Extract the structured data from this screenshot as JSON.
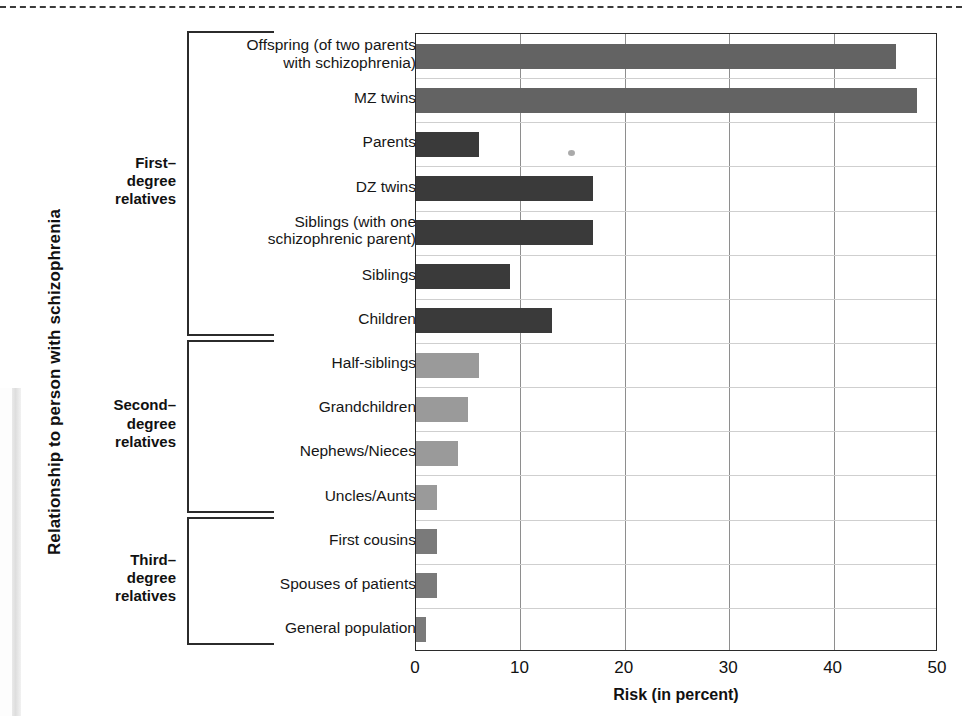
{
  "axes": {
    "y_title": "Relationship to person with schizophrenia",
    "x_title": "Risk (in percent)",
    "x_ticks": [
      "0",
      "10",
      "20",
      "30",
      "40",
      "50"
    ]
  },
  "groups": [
    {
      "name_line1": "First–",
      "name_line2": "degree",
      "name_line3": "relatives"
    },
    {
      "name_line1": "Second–",
      "name_line2": "degree",
      "name_line3": "relatives"
    },
    {
      "name_line1": "Third–",
      "name_line2": "degree",
      "name_line3": "relatives"
    }
  ],
  "categories": [
    {
      "line1": "Offspring (of two parents",
      "line2": "with schizophrenia)"
    },
    {
      "line1": "MZ twins",
      "line2": ""
    },
    {
      "line1": "Parents",
      "line2": ""
    },
    {
      "line1": "DZ twins",
      "line2": ""
    },
    {
      "line1": "Siblings (with one",
      "line2": "schizophrenic parent)"
    },
    {
      "line1": "Siblings",
      "line2": ""
    },
    {
      "line1": "Children",
      "line2": ""
    },
    {
      "line1": "Half-siblings",
      "line2": ""
    },
    {
      "line1": "Grandchildren",
      "line2": ""
    },
    {
      "line1": "Nephews/Nieces",
      "line2": ""
    },
    {
      "line1": "Uncles/Aunts",
      "line2": ""
    },
    {
      "line1": "First cousins",
      "line2": ""
    },
    {
      "line1": "Spouses  of patients",
      "line2": ""
    },
    {
      "line1": "General population",
      "line2": ""
    }
  ],
  "colors": {
    "bar_first_degree_light": "#636363",
    "bar_first_degree_dark": "#3a3a3a",
    "bar_second_degree": "#9a9a9a",
    "bar_third_degree": "#7a7a7a",
    "axis": "#2b2b2b",
    "gridline_vertical": "#8e8e8e",
    "gridline_horizontal": "#cfcfcf"
  },
  "chart_data": {
    "type": "bar",
    "orientation": "horizontal",
    "title": "",
    "xlabel": "Risk (in percent)",
    "ylabel": "Relationship to person with schizophrenia",
    "xlim": [
      0,
      50
    ],
    "xticks": [
      0,
      10,
      20,
      30,
      40,
      50
    ],
    "grid": true,
    "legend": "none",
    "categories": [
      "Offspring (of two parents with schizophrenia)",
      "MZ twins",
      "Parents",
      "DZ twins",
      "Siblings (with one schizophrenic parent)",
      "Siblings",
      "Children",
      "Half-siblings",
      "Grandchildren",
      "Nephews/Nieces",
      "Uncles/Aunts",
      "First cousins",
      "Spouses of patients",
      "General population"
    ],
    "values": [
      46,
      48,
      6,
      17,
      17,
      9,
      13,
      6,
      5,
      4,
      2,
      2,
      2,
      1
    ],
    "bar_colors": [
      "#636363",
      "#636363",
      "#3a3a3a",
      "#3a3a3a",
      "#3a3a3a",
      "#3a3a3a",
      "#3a3a3a",
      "#9a9a9a",
      "#9a9a9a",
      "#9a9a9a",
      "#9a9a9a",
      "#7a7a7a",
      "#7a7a7a",
      "#7a7a7a"
    ],
    "group_assignment": [
      "First-degree relatives",
      "First-degree relatives",
      "First-degree relatives",
      "First-degree relatives",
      "First-degree relatives",
      "First-degree relatives",
      "First-degree relatives",
      "Second-degree relatives",
      "Second-degree relatives",
      "Second-degree relatives",
      "Second-degree relatives",
      "Third-degree relatives",
      "Third-degree relatives",
      "Third-degree relatives"
    ]
  }
}
